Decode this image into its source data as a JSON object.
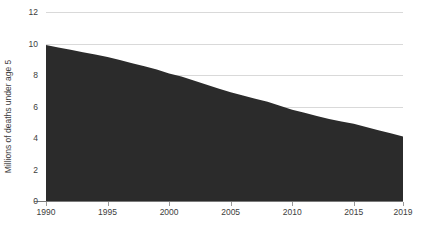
{
  "chart_data": {
    "type": "area",
    "title": "",
    "subtitle": "",
    "xlabel": "",
    "ylabel": "Millions of deaths under age 5",
    "xlim": [
      1990,
      2019
    ],
    "ylim": [
      0,
      12
    ],
    "grid": true,
    "legend": "none",
    "fill_color": "#2b2b2b",
    "grid_color": "#d9d9d9",
    "axis_color": "#7a7a7a",
    "background_color": "#ffffff",
    "y_ticks": [
      0,
      2,
      4,
      6,
      8,
      10,
      12
    ],
    "y_tick_labels": [
      "0",
      "2",
      "4",
      "6",
      "8",
      "10",
      "12"
    ],
    "x_ticks": [
      1990,
      1995,
      2000,
      2005,
      2010,
      2015,
      2019
    ],
    "x_tick_labels": [
      "1990",
      "1995",
      "2000",
      "2005",
      "2010",
      "2015",
      "2019"
    ],
    "x": [
      1990,
      1991,
      1992,
      1993,
      1994,
      1995,
      1996,
      1997,
      1998,
      1999,
      2000,
      2001,
      2002,
      2003,
      2004,
      2005,
      2006,
      2007,
      2008,
      2009,
      2010,
      2011,
      2012,
      2013,
      2014,
      2015,
      2016,
      2017,
      2018,
      2019
    ],
    "values": [
      9.9,
      9.75,
      9.6,
      9.45,
      9.3,
      9.15,
      8.95,
      8.75,
      8.55,
      8.35,
      8.1,
      7.9,
      7.65,
      7.4,
      7.15,
      6.9,
      6.7,
      6.5,
      6.3,
      6.05,
      5.8,
      5.6,
      5.4,
      5.2,
      5.05,
      4.9,
      4.7,
      4.5,
      4.3,
      4.1
    ],
    "series": [
      {
        "name": "Deaths under age 5",
        "values": [
          9.9,
          9.75,
          9.6,
          9.45,
          9.3,
          9.15,
          8.95,
          8.75,
          8.55,
          8.35,
          8.1,
          7.9,
          7.65,
          7.4,
          7.15,
          6.9,
          6.7,
          6.5,
          6.3,
          6.05,
          5.8,
          5.6,
          5.4,
          5.2,
          5.05,
          4.9,
          4.7,
          4.5,
          4.3,
          4.1
        ]
      }
    ]
  },
  "layout": {
    "plot_left": 46,
    "plot_right": 403,
    "plot_top": 12,
    "plot_bottom": 201,
    "tick_length": 4,
    "x_label_y": 215,
    "y_label_dx": 4,
    "y_axis_title_x": 11
  }
}
